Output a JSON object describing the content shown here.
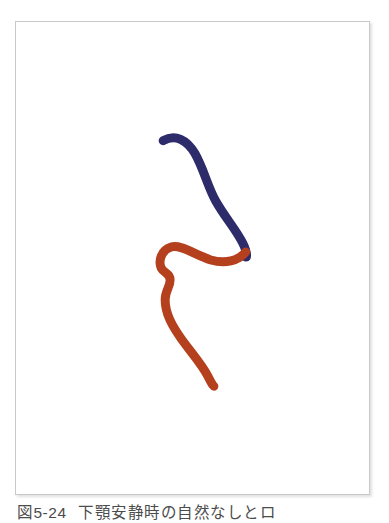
{
  "page": {
    "background_color": "#ffffff",
    "width": 389,
    "height": 523
  },
  "figure": {
    "panel_border_color": "#c9c9c9",
    "panel_background": "#ffffff",
    "caption_number": "図5-24",
    "caption_text": "下顎安静時の自然なしとロ",
    "caption_color": "#4c4c4c",
    "curves": {
      "blue": {
        "label": "blue-curve",
        "color": "#2e2b6b",
        "stroke_width": 9
      },
      "red": {
        "label": "red-curve",
        "color": "#b4401e",
        "stroke_width": 9
      }
    }
  },
  "chart_data": {
    "type": "line",
    "title": "図5-24 下顎安静時の自然なしとロ",
    "xlabel": "",
    "ylabel": "",
    "series": [
      {
        "name": "blue-curve",
        "color": "#2e2b6b",
        "path": "M 148,119 C 160,112 172,118 180,132 C 189,148 193,166 201,180 C 210,196 221,208 228,222 C 233,232 233,240 229,234"
      },
      {
        "name": "red-curve",
        "color": "#b4401e",
        "path": "M 231,231 C 224,240 210,243 196,239 C 180,234 166,223 156,226 C 146,229 143,240 146,247 C 149,253 155,252 155,259 C 155,266 150,270 150,279 C 150,293 157,305 166,318 C 176,332 187,344 193,356 C 198,366 199,366 199,366"
      }
    ]
  }
}
